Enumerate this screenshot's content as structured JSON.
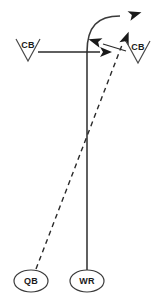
{
  "diagram": {
    "type": "play-diagram",
    "colors": {
      "route": "#3a3a3a",
      "pass": "#2a2a2a",
      "defender": "#4a4a4a",
      "text": "#1a1a1a",
      "background": "#ffffff"
    }
  },
  "players": {
    "qb": {
      "label": "QB",
      "shape": "oval",
      "cx": 31,
      "cy": 281,
      "rx": 17,
      "ry": 11
    },
    "wr": {
      "label": "WR",
      "shape": "oval",
      "cx": 87,
      "cy": 281,
      "rx": 17,
      "ry": 11
    }
  },
  "defenders": [
    {
      "label": "CB",
      "shape": "v-marker",
      "id": "cb-left",
      "x": 16,
      "y": 39,
      "width": 24,
      "height": 22
    },
    {
      "label": "CB",
      "shape": "v-marker",
      "id": "cb-right",
      "x": 126,
      "y": 41,
      "width": 24,
      "height": 22
    }
  ],
  "routes": {
    "wr_route": {
      "name": "curl-hook",
      "style": "solid",
      "path": "M 87 270 L 87 52 C 87 26 98 16 120 16"
    },
    "pass_trajectory": {
      "name": "pass",
      "style": "dashed",
      "path": "M 36 269 L 122 45"
    },
    "defender_move": {
      "name": "cb-break",
      "style": "solid",
      "path": "M 126 51 L 103 44"
    },
    "cb_press": {
      "name": "cb-horizontal",
      "style": "solid",
      "path": "M 38 52 L 100 52"
    }
  },
  "arrows": [
    {
      "name": "route-end-arrow",
      "x": 129,
      "y": 16,
      "angle": -17
    },
    {
      "name": "pass-end-arrow",
      "x": 123,
      "y": 43,
      "angle": -68
    },
    {
      "name": "defender-break-arrow",
      "x": 100,
      "y": 43,
      "angle": 197
    },
    {
      "name": "press-end-arrow",
      "x": 102,
      "y": 52,
      "angle": 0
    }
  ]
}
